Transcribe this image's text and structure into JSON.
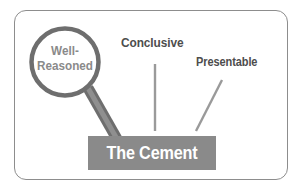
{
  "diagram": {
    "title_hidden": "",
    "magnifier": {
      "icon": "magnifying-glass-icon",
      "label_line1": "Well-",
      "label_line2": "Reasoned",
      "label_full": "Well-Reasoned",
      "ring_color": "#6e6e6e",
      "text_color": "#8a8a8a"
    },
    "labels": [
      {
        "id": "conclusive",
        "text": "Conclusive",
        "color": "#4d4d4d",
        "connector": "vertical-line"
      },
      {
        "id": "presentable",
        "text": "Presentable",
        "color": "#4d4d4d",
        "connector": "diagonal-line"
      }
    ],
    "base": {
      "text": "The Cement",
      "fill_color": "#8a8a8a",
      "text_color": "#ffffff"
    },
    "frame": {
      "border_color": "#8d8d8d",
      "background": "#ffffff"
    },
    "connector_color": "#9a9a9a"
  }
}
